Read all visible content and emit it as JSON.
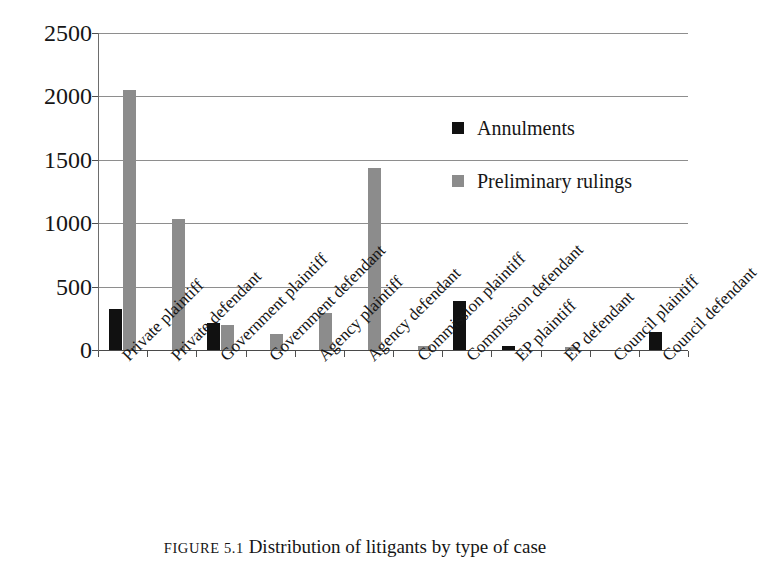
{
  "chart_data": {
    "type": "bar",
    "title": "",
    "caption_prefix": "FIGURE 5.1",
    "caption_text": "Distribution of litigants by type of case",
    "xlabel": "",
    "ylabel": "",
    "ylim": [
      0,
      2500
    ],
    "ytick_values": [
      0,
      500,
      1000,
      1500,
      2000,
      2500
    ],
    "ytick_labels": [
      "0",
      "500",
      "1000",
      "1500",
      "2000",
      "2500"
    ],
    "grid": true,
    "legend_position": "inside-upper-right",
    "categories": [
      "Private plaintiff",
      "Private defendant",
      "Government plaintiff",
      "Government defendant",
      "Agency plaintiff",
      "Agency defendant",
      "Commission plaintiff",
      "Commission defendant",
      "EP plaintiff",
      "EP defendant",
      "Council plaintiff",
      "Council defendant"
    ],
    "series": [
      {
        "name": "Annulments",
        "color": "#111111",
        "values": [
          320,
          0,
          215,
          0,
          0,
          0,
          0,
          390,
          30,
          0,
          0,
          145
        ]
      },
      {
        "name": "Preliminary rulings",
        "color": "#8c8c8c",
        "values": [
          2050,
          1030,
          200,
          125,
          290,
          1435,
          30,
          0,
          0,
          25,
          0,
          0
        ]
      }
    ]
  },
  "legend": {
    "items": [
      {
        "label": "Annulments",
        "swatch": "annul",
        "icon": "square-marker-icon"
      },
      {
        "label": "Preliminary rulings",
        "swatch": "prelim",
        "icon": "square-marker-icon"
      }
    ]
  }
}
